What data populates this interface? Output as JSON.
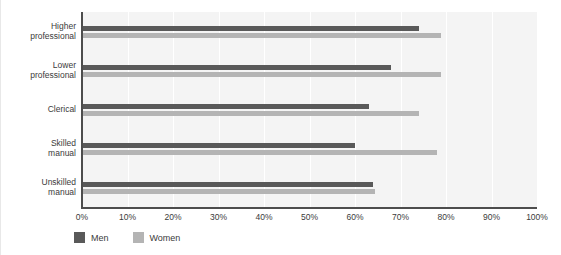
{
  "chart_data": {
    "type": "bar",
    "orientation": "horizontal",
    "title": "",
    "xlabel": "",
    "ylabel": "",
    "categories": [
      "Higher professional",
      "Lower professional",
      "Clerical",
      "Skilled manual",
      "Unskilled manual"
    ],
    "category_lines": [
      [
        "Higher",
        "professional"
      ],
      [
        "Lower",
        "professional"
      ],
      [
        "Clerical",
        ""
      ],
      [
        "Skilled",
        "manual"
      ],
      [
        "Unskilled",
        "manual"
      ]
    ],
    "series": [
      {
        "name": "Men",
        "color": "#595959",
        "values": [
          74,
          68,
          63,
          60,
          64
        ]
      },
      {
        "name": "Women",
        "color": "#b4b4b4",
        "values": [
          79,
          79,
          74,
          78,
          64.5
        ]
      }
    ],
    "xlim": [
      0,
      100
    ],
    "xticks": [
      0,
      10,
      20,
      30,
      40,
      50,
      60,
      70,
      80,
      90,
      100
    ],
    "xtick_labels": [
      "0%",
      "10%",
      "20%",
      "30%",
      "40%",
      "50%",
      "60%",
      "70%",
      "80%",
      "90%",
      "100%"
    ],
    "grid": true,
    "grid_axis": "x",
    "legend_position": "bottom-left",
    "plot_background": "#f4f4f4",
    "axis_color": "#4d4d4d"
  },
  "legend": {
    "items": [
      {
        "label": "Men",
        "color": "#595959"
      },
      {
        "label": "Women",
        "color": "#b4b4b4"
      }
    ]
  }
}
